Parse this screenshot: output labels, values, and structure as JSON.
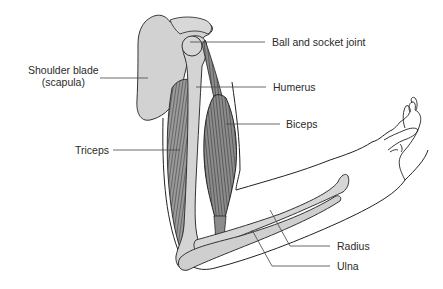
{
  "diagram": {
    "labels": [
      {
        "id": "shoulder-blade",
        "text": "Shoulder blade",
        "sub": "(scapula)"
      },
      {
        "id": "ball-socket",
        "text": "Ball and socket joint"
      },
      {
        "id": "humerus",
        "text": "Humerus"
      },
      {
        "id": "biceps",
        "text": "Biceps"
      },
      {
        "id": "triceps",
        "text": "Triceps"
      },
      {
        "id": "radius",
        "text": "Radius"
      },
      {
        "id": "ulna",
        "text": "Ulna"
      }
    ],
    "colors": {
      "bone": "#d4d4d4",
      "muscle": "#8a8a8a",
      "outline": "#333333",
      "leader": "#444444"
    }
  }
}
